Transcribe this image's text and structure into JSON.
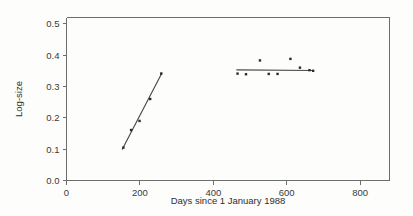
{
  "chart_data": {
    "type": "scatter",
    "title": "",
    "subtitle": "",
    "xlabel": "Days since 1 January 1988",
    "ylabel": "Log-size",
    "xlim": [
      0,
      880
    ],
    "ylim": [
      0.0,
      0.52
    ],
    "grid": false,
    "legend": "none",
    "x_ticks": [
      0,
      200,
      400,
      600,
      800
    ],
    "x_tick_labels": [
      "0",
      "200",
      "400",
      "600",
      "800"
    ],
    "y_ticks": [
      0.0,
      0.1,
      0.2,
      0.3,
      0.4,
      0.5
    ],
    "y_tick_labels": [
      "0.0",
      "0.1",
      "0.2",
      "0.3",
      "0.4",
      "0.5"
    ],
    "series": [
      {
        "name": "Early growth phase",
        "marker": "square",
        "x": [
          155,
          176,
          199,
          228,
          258
        ],
        "y": [
          0.105,
          0.161,
          0.19,
          0.26,
          0.341
        ]
      },
      {
        "name": "Plateau phase",
        "marker": "square",
        "x": [
          466,
          489,
          527,
          551,
          575,
          610,
          636,
          662,
          672
        ],
        "y": [
          0.341,
          0.339,
          0.383,
          0.34,
          0.34,
          0.388,
          0.36,
          0.352,
          0.35
        ]
      }
    ],
    "fit_lines": [
      {
        "name": "Early growth fit",
        "x": [
          152,
          260
        ],
        "y": [
          0.1,
          0.343
        ]
      },
      {
        "name": "Plateau fit",
        "x": [
          464,
          672
        ],
        "y": [
          0.353,
          0.351
        ]
      }
    ]
  },
  "axis_titles": {
    "x": "Days since 1 January 1988",
    "y": "Log-size"
  },
  "colors": {
    "background": "#fdfdfc",
    "axis": "#6d6d6d",
    "marker": "#2b2b2b",
    "fit_line": "#4a4a4a",
    "text": "#2e2e2e"
  }
}
